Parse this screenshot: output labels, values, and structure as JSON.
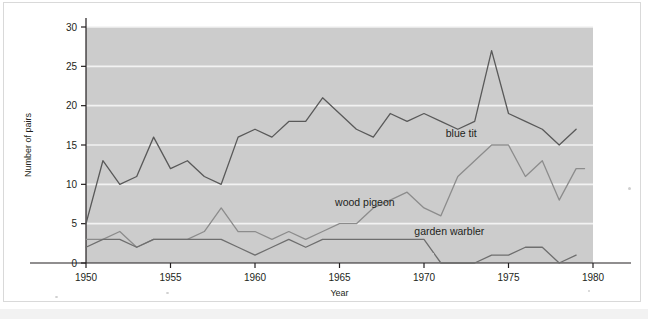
{
  "figure": {
    "background_color": "#ffffff",
    "plot_background_color": "#cccccc",
    "gridline_color": "#f2f2f2",
    "axis_color": "#231f20",
    "line_color_blue_tit": "#595959",
    "line_color_wood_pigeon": "#8c8c8c",
    "line_color_garden_warbler": "#6e6e6e"
  },
  "chart_data": {
    "type": "line",
    "title": "",
    "xlabel": "Year",
    "ylabel": "Number of pairs",
    "xlim": [
      1950,
      1980
    ],
    "ylim": [
      0,
      30
    ],
    "xticks": [
      1950,
      1955,
      1960,
      1965,
      1970,
      1975,
      1980
    ],
    "xtick_labels": [
      "1950",
      "1955",
      "1960",
      "1965",
      "1970",
      "1975",
      "1980"
    ],
    "yticks": [
      0,
      5,
      10,
      15,
      20,
      25,
      30
    ],
    "ytick_labels": [
      "0",
      "5",
      "10",
      "15",
      "20",
      "25",
      "30"
    ],
    "grid": "horizontal",
    "legend_position": "inline-annotations",
    "x": [
      1950,
      1951,
      1952,
      1953,
      1954,
      1955,
      1956,
      1957,
      1958,
      1959,
      1960,
      1961,
      1962,
      1963,
      1964,
      1965,
      1966,
      1967,
      1968,
      1969,
      1970,
      1971,
      1972,
      1973,
      1974,
      1975,
      1976,
      1977,
      1978,
      1979
    ],
    "series": [
      {
        "name": "blue tit",
        "label": "blue tit",
        "color": "#595959",
        "values": [
          5,
          13,
          10,
          11,
          16,
          12,
          13,
          11,
          10,
          16,
          17,
          16,
          18,
          18,
          21,
          19,
          17,
          16,
          19,
          18,
          19,
          18,
          17,
          18,
          27,
          19,
          18,
          17,
          15,
          17
        ]
      },
      {
        "name": "wood pigeon",
        "label": "wood pigeon",
        "color": "#8c8c8c",
        "values": [
          3,
          3,
          4,
          2,
          3,
          3,
          3,
          4,
          7,
          4,
          4,
          3,
          4,
          3,
          4,
          5,
          5,
          7,
          8,
          9,
          7,
          6,
          11,
          13,
          15,
          15,
          11,
          13,
          8,
          12
        ],
        "extra_points": [
          {
            "x": 1979.5,
            "y": 12
          }
        ]
      },
      {
        "name": "garden warbler",
        "label": "garden warbler",
        "color": "#6e6e6e",
        "values": [
          2,
          3,
          3,
          2,
          3,
          3,
          3,
          3,
          3,
          2,
          1,
          2,
          3,
          2,
          3,
          3,
          3,
          3,
          3,
          3,
          3,
          0,
          0,
          0,
          1,
          1,
          2,
          2,
          0,
          1
        ]
      }
    ],
    "annotations": [
      {
        "text": "blue tit",
        "x": 1972.2,
        "y": 16.0
      },
      {
        "text": "wood pigeon",
        "x": 1966.5,
        "y": 7.2
      },
      {
        "text": "garden warbler",
        "x": 1971.5,
        "y": 3.6
      }
    ]
  }
}
